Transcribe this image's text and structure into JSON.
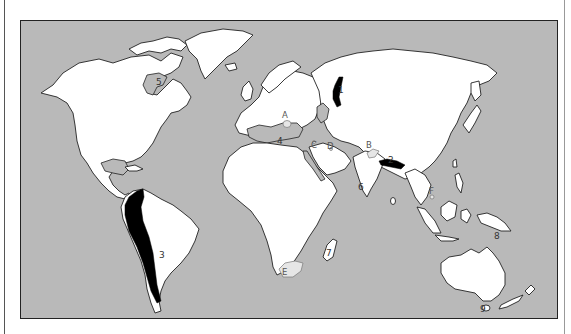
{
  "map": {
    "colors": {
      "ocean": "#b9b9b9",
      "land": "#ffffff",
      "outline": "#222222",
      "major_region": "#000000",
      "minor_region": "#e6e6e6"
    },
    "numbered_labels": [
      {
        "id": "1",
        "text": "1",
        "location": "Ural Mountains"
      },
      {
        "id": "2",
        "text": "2",
        "location": "Himalaya"
      },
      {
        "id": "3",
        "text": "3",
        "location": "Andes"
      },
      {
        "id": "4",
        "text": "4",
        "location": "Mediterranean Sea"
      },
      {
        "id": "5",
        "text": "5",
        "location": "Hudson Bay"
      },
      {
        "id": "6",
        "text": "6",
        "location": "Arabian Sea / Indian Ocean"
      },
      {
        "id": "7",
        "text": "7",
        "location": "Madagascar"
      },
      {
        "id": "8",
        "text": "8",
        "location": "New Guinea"
      },
      {
        "id": "9",
        "text": "9",
        "location": "Tasmania"
      }
    ],
    "letter_labels": [
      {
        "id": "A",
        "text": "A",
        "location": "Alps / Northern Italy"
      },
      {
        "id": "B",
        "text": "B",
        "location": "Tibet"
      },
      {
        "id": "C",
        "text": "C",
        "location": "Eastern Mediterranean coast"
      },
      {
        "id": "D",
        "text": "D",
        "location": "Persian Gulf"
      },
      {
        "id": "E",
        "text": "E",
        "location": "South Africa"
      },
      {
        "id": "F",
        "text": "F",
        "location": "Southeast Asia / Gulf of Thailand"
      }
    ]
  }
}
